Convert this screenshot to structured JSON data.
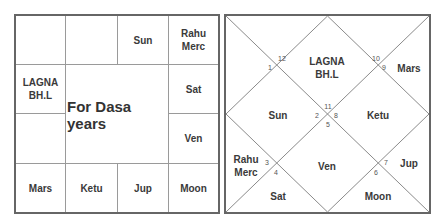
{
  "south_chart": {
    "center_label": "For Dasa years",
    "cells": {
      "r0c0": "",
      "r0c1": "",
      "r0c2": "Sun",
      "r0c3": "Rahu\nMerc",
      "r1c0": "LAGNA\nBH.L",
      "r1c3": "Sat",
      "r2c0": "",
      "r2c3": "Ven",
      "r3c0": "Mars",
      "r3c1": "Ketu",
      "r3c2": "Jup",
      "r3c3": "Moon"
    }
  },
  "north_chart": {
    "houses": {
      "h1": "LAGNA\nBH.L",
      "h2": "Sun",
      "h3": "Rahu\nMerc",
      "h4": "Sat",
      "h5": "Ven",
      "h6": "Moon",
      "h7": "Jup",
      "h8": "Ketu",
      "h9": "Mars"
    },
    "sign_numbers": {
      "n1": "1",
      "n2": "2",
      "n3": "3",
      "n4": "4",
      "n5": "5",
      "n6": "6",
      "n7": "7",
      "n8": "8",
      "n9": "9",
      "n10": "10",
      "n11": "11",
      "n12": "12"
    }
  },
  "colors": {
    "border": "#666666",
    "grid": "#9a9a9a",
    "text": "#3a3a3a"
  }
}
